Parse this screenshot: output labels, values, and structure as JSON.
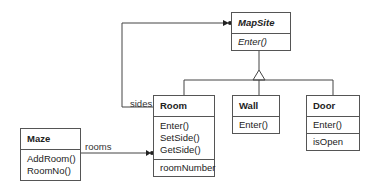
{
  "classes": {
    "mapsite": {
      "name": "MapSite",
      "operations": [
        "Enter()"
      ],
      "abstract": true
    },
    "room": {
      "name": "Room",
      "operations": [
        "Enter()",
        "SetSide()",
        "GetSide()"
      ],
      "attributes": [
        "roomNumber"
      ]
    },
    "wall": {
      "name": "Wall",
      "operations": [
        "Enter()"
      ]
    },
    "door": {
      "name": "Door",
      "operations": [
        "Enter()"
      ],
      "attributes": [
        "isOpen"
      ]
    },
    "maze": {
      "name": "Maze",
      "operations": [
        "AddRoom()",
        "RoomNo()"
      ]
    }
  },
  "relations": {
    "sides": "sides",
    "rooms": "rooms"
  }
}
